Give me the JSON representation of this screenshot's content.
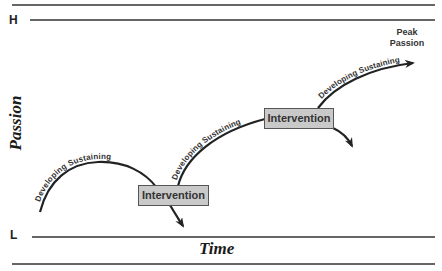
{
  "axes": {
    "y_high": "H",
    "y_low": "L",
    "y_title": "Passion",
    "x_title": "Time"
  },
  "peak_label": {
    "line1": "Peak",
    "line2": "Passion"
  },
  "arcs": [
    {
      "stage1": "Developing",
      "stage2": "Sustaining"
    },
    {
      "stage1": "Developing",
      "stage2": "Sustaining"
    },
    {
      "stage1": "Developing",
      "stage2": "Sustaining"
    }
  ],
  "interventions": [
    {
      "label": "Intervention"
    },
    {
      "label": "Intervention"
    }
  ],
  "colors": {
    "line": "#222222",
    "box_fill": "#c9c9c9",
    "box_border": "#555555"
  }
}
